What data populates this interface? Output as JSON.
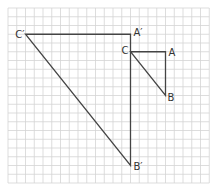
{
  "diagram": {
    "type": "grid-triangle-dilation",
    "grid": {
      "origin_x": 8,
      "origin_y": 8,
      "spacing": 8.75,
      "cols": 23,
      "rows": 20,
      "line_color": "#d4d4d4",
      "background": "#ffffff"
    },
    "stroke_color": "#444444",
    "triangles": [
      {
        "name": "original",
        "vertices": [
          {
            "label": "C",
            "col": 14,
            "row": 5
          },
          {
            "label": "A",
            "col": 18,
            "row": 5
          },
          {
            "label": "B",
            "col": 18,
            "row": 10
          }
        ]
      },
      {
        "name": "image",
        "vertices": [
          {
            "label": "C′",
            "col": 2,
            "row": 3
          },
          {
            "label": "A′",
            "col": 14,
            "row": 3
          },
          {
            "label": "B′",
            "col": 14,
            "row": 18
          }
        ]
      }
    ],
    "labels": {
      "C": "C",
      "A": "A",
      "B": "B",
      "C_prime": "C′",
      "A_prime": "A′",
      "B_prime": "B′"
    }
  }
}
